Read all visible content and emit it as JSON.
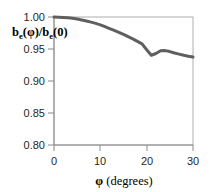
{
  "chart_data": {
    "type": "line",
    "title": "",
    "xlabel": "φ (degrees)",
    "ylabel": "bₑ(φ)/bₑ(0)",
    "ylabel_parts": {
      "b1": "b",
      "sub1": "e",
      "paren1": "(φ)/",
      "b2": "b",
      "sub2": "e",
      "paren2": "(0)"
    },
    "xlabel_parts": {
      "symbol": "φ",
      "unit": "(degrees)"
    },
    "xlim": [
      0,
      30
    ],
    "ylim": [
      0.8,
      1.0
    ],
    "xticks": [
      0,
      10,
      20,
      30
    ],
    "xtick_labels": [
      "0",
      "10",
      "20",
      "30"
    ],
    "yticks": [
      0.8,
      0.85,
      0.9,
      0.95,
      1.0
    ],
    "ytick_labels": [
      "0.80",
      "0.85",
      "0.90",
      "0.95",
      "1.00"
    ],
    "grid": false,
    "legend": false,
    "series": [
      {
        "name": "b_e(phi)/b_e(0)",
        "color": "#5f5f5f",
        "x": [
          0,
          1,
          2,
          3,
          4,
          5,
          6,
          7,
          8,
          9,
          10,
          11,
          12,
          13,
          14,
          15,
          16,
          17,
          18,
          19,
          20,
          21,
          22,
          23,
          24,
          25,
          26,
          27,
          28,
          29,
          30
        ],
        "values": [
          1.0,
          1.0,
          0.999,
          0.999,
          0.998,
          0.997,
          0.995,
          0.994,
          0.992,
          0.99,
          0.988,
          0.985,
          0.982,
          0.979,
          0.976,
          0.973,
          0.969,
          0.966,
          0.962,
          0.958,
          0.954,
          0.929,
          0.949,
          0.945,
          0.95,
          0.945,
          0.944,
          0.942,
          0.94,
          0.939,
          0.937
        ]
      }
    ],
    "colors": {
      "curve": "#5f5f5f",
      "axis": "#8a8a8a",
      "border": "#aeaeae",
      "text": "#1f1f1f",
      "background": "#ffffff"
    }
  }
}
